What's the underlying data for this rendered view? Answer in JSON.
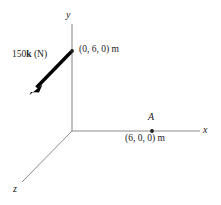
{
  "figure": {
    "background_color": "#ffffff",
    "axis_color": "#8c8c8c",
    "vector_color": "#000000",
    "text_color": "#1a1a1a",
    "axes": [
      {
        "name": "x",
        "label": "x",
        "from": [
          72,
          131
        ],
        "to": [
          200,
          131
        ]
      },
      {
        "name": "y",
        "label": "y",
        "from": [
          72,
          131
        ],
        "to": [
          72,
          24
        ]
      },
      {
        "name": "z",
        "label": "z",
        "from": [
          72,
          131
        ],
        "to": [
          22,
          182
        ]
      }
    ],
    "origin": [
      72,
      131
    ],
    "vector": {
      "label_value": "150",
      "label_unit_vector": "k",
      "label_units": "(N)",
      "label_full": "150k (N)",
      "tail": [
        72,
        51
      ],
      "tip": [
        31,
        93
      ],
      "applied_at_label": "(0, 6, 0) m"
    },
    "points": [
      {
        "name": "A",
        "label": "A",
        "coord_label": "(6, 0, 0) m",
        "position": [
          152,
          131
        ]
      }
    ]
  }
}
